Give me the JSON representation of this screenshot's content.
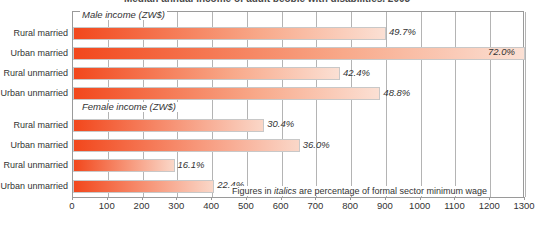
{
  "chart_data": {
    "type": "bar",
    "orientation": "horizontal",
    "title": "Median annual income of adult people with disabilities, 2003",
    "xlabel": "",
    "ylabel": "",
    "xlim": [
      0,
      1300
    ],
    "xticks": [
      0,
      100,
      200,
      300,
      400,
      500,
      600,
      700,
      800,
      900,
      1000,
      1100,
      1200,
      1300
    ],
    "grid": true,
    "legend": false,
    "groups": [
      {
        "header": "Male income (ZW$)",
        "categories": [
          "Rural married",
          "Urban married",
          "Rural unmarried",
          "Urban unmarried"
        ],
        "values": [
          900,
          1300,
          768,
          884
        ],
        "labels": [
          "49.7%",
          "72.0%",
          "42.4%",
          "48.8%"
        ]
      },
      {
        "header": "Female income (ZW$)",
        "categories": [
          "Rural married",
          "Urban married",
          "Rural unmarried",
          "Urban unmarried"
        ],
        "values": [
          550,
          652,
          292,
          406
        ],
        "labels": [
          "30.4%",
          "36.0%",
          "16.1%",
          "22.4%"
        ]
      }
    ],
    "annotations": [
      "Figures in italics are percentage of formal sector minimum wage"
    ],
    "colors": {
      "bar_start": "#f2471c",
      "bar_end": "#fbe0d4",
      "grid": "#b4b4b4",
      "frame": "#9a9a9a",
      "text": "#333333",
      "background": "#ffffff"
    }
  },
  "footnote": {
    "prefix": "Figures in ",
    "emphasis": "italics",
    "suffix": " are percentage of formal sector minimum wage"
  }
}
